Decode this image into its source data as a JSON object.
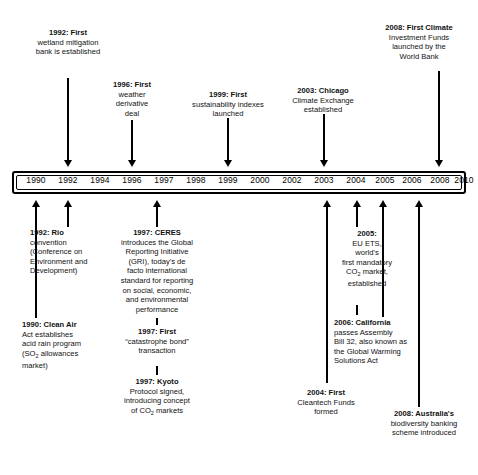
{
  "figure": {
    "type": "timeline",
    "orientation": "horizontal",
    "axis_label": "years"
  },
  "axis": {
    "years": [
      {
        "label": "1990",
        "x": 36
      },
      {
        "label": "1992",
        "x": 68
      },
      {
        "label": "1994",
        "x": 100
      },
      {
        "label": "1996",
        "x": 132
      },
      {
        "label": "1997",
        "x": 164
      },
      {
        "label": "1998",
        "x": 196
      },
      {
        "label": "1999",
        "x": 228
      },
      {
        "label": "2000",
        "x": 260
      },
      {
        "label": "2002",
        "x": 292
      },
      {
        "label": "2003",
        "x": 324
      },
      {
        "label": "2004",
        "x": 356
      },
      {
        "label": "2005",
        "x": 385
      },
      {
        "label": "2006",
        "x": 412
      },
      {
        "label": "2008",
        "x": 440
      },
      {
        "label": "2010",
        "x": 464
      }
    ]
  },
  "events_above": [
    {
      "id": "e1992-wetland",
      "year": "1992",
      "year_label": "1992:",
      "lines": [
        "1992:  First",
        "wetland mitigation",
        "bank is established"
      ],
      "text": "1992: First wetland mitigation bank is established"
    },
    {
      "id": "e1996-weather-derivative",
      "year": "1996",
      "year_label": "1996:",
      "lines": [
        "1996:  First",
        "weather",
        "derivative",
        "deal"
      ],
      "text": "1996: First weather derivative deal"
    },
    {
      "id": "e1999-sustainability-indexes",
      "year": "1999",
      "year_label": "1999:",
      "lines": [
        "1999:  First",
        "sustainability indexes",
        "launched"
      ],
      "text": "1999: First sustainability indexes launched"
    },
    {
      "id": "e2003-chicago-climate-exchange",
      "year": "2003",
      "year_label": "2003:",
      "lines": [
        "2003:  Chicago",
        "Climate Exchange",
        "established"
      ],
      "text": "2003: Chicago Climate Exchange established"
    },
    {
      "id": "e2008-climate-investment-funds",
      "year": "2008",
      "year_label": "2008:",
      "lines": [
        "2008:  First Climate",
        "Investment Funds",
        "launched by the",
        "World Bank"
      ],
      "text": "2008: First Climate Investment Funds launched by the World Bank"
    }
  ],
  "events_below": [
    {
      "id": "e1992-rio-convention",
      "year": "1992",
      "year_label": "1992:",
      "lines": [
        "1992:  Rio",
        "convention",
        "(Conference on",
        "Environment and",
        "Development)"
      ],
      "text": "1992: Rio convention (Conference on Environment and Development)"
    },
    {
      "id": "e1990-clean-air-act",
      "year": "1990",
      "year_label": "1990:",
      "lines": [
        "1990:  Clean Air",
        "Act establishes",
        "acid rain program",
        "(SO2 allowances",
        "market)"
      ],
      "text": "1990: Clean Air Act establishes acid rain program (SO2 allowances market)"
    },
    {
      "id": "e1997-ceres-gri",
      "year": "1997",
      "year_label": "1997:",
      "lines": [
        "1997:  CERES",
        "introduces the Global",
        "Reporting Initiative",
        "(GRI), today's de",
        "facto international",
        "standard for reporting",
        "on social, economic,",
        "and  environmental",
        "performance"
      ],
      "text": "1997: CERES introduces the Global Reporting Initiative (GRI), today's de facto international standard for reporting on social, economic, and environmental performance"
    },
    {
      "id": "e1997-catastrophe-bond",
      "year": "1997",
      "year_label": "1997:",
      "lines": [
        "1997:  First",
        "“catastrophe bond”",
        "transaction"
      ],
      "text": "1997: First “catastrophe bond” transaction"
    },
    {
      "id": "e1997-kyoto-protocol",
      "year": "1997",
      "year_label": "1997:",
      "lines": [
        "1997:  Kyoto",
        "Protocol signed,",
        "introducing concept",
        "of CO2 markets"
      ],
      "text": "1997: Kyoto Protocol signed, introducing concept of CO2 markets"
    },
    {
      "id": "e2005-eu-ets",
      "year": "2005",
      "year_label": "2005:",
      "lines": [
        "2005:",
        "EU ETS,",
        "world's",
        "first mandatory",
        "CO2 market,",
        "established"
      ],
      "text": "2005: EU ETS, world's first mandatory CO2 market, established"
    },
    {
      "id": "e2006-california-ab32",
      "year": "2006",
      "year_label": "2006:",
      "lines": [
        "2006:  California",
        "passes Assembly",
        "Bill 32, also known as",
        "the Global Warming",
        "Solutions Act"
      ],
      "text": "2006: California passes Assembly Bill 32, also known as the Global Warming Solutions Act"
    },
    {
      "id": "e2004-cleantech-funds",
      "year": "2004",
      "year_label": "2004:",
      "lines": [
        "2004:  First",
        "Cleantech Funds",
        "formed"
      ],
      "text": "2004: First Cleantech Funds formed"
    },
    {
      "id": "e2008-australia-biodiversity",
      "year": "2008",
      "year_label": "2008:",
      "lines": [
        "2008:  Australia's",
        "biodiversity banking",
        "scheme introduced"
      ],
      "text": "2008: Australia's biodiversity banking scheme introduced"
    }
  ],
  "colors": {
    "ink": "#000000",
    "text": "#111111",
    "background": "#ffffff"
  }
}
